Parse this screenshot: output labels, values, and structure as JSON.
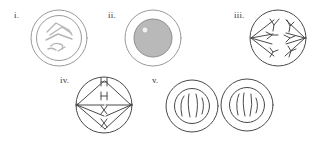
{
  "document": {
    "title": "Stages of Mitosis — Unlabeled Cell Diagrams",
    "background_color": "#ffffff",
    "ink_color": "#6e6e6e",
    "dark_ink_color": "#4a4a4a",
    "nucleus_fill_color": "#b9b9b9",
    "width": 318,
    "height": 142
  },
  "figures": [
    {
      "label": "i.",
      "name": "figure-i-prophase",
      "description": "Cell with outer plasma membrane, inner nuclear envelope, and several condensed rod-like chromosomes inside the nucleus",
      "chromosome_count": 4,
      "has_nuclear_envelope": true,
      "has_spindle": false,
      "nucleus_filled": false,
      "cell_count": 1
    },
    {
      "label": "ii.",
      "name": "figure-ii-interphase",
      "description": "Cell with outer membrane and a large solid shaded nucleus containing a small pale nucleolus",
      "chromosome_count": 0,
      "has_nuclear_envelope": true,
      "has_spindle": false,
      "nucleus_filled": true,
      "nucleolus_visible": true,
      "cell_count": 1
    },
    {
      "label": "iii.",
      "name": "figure-iii-anaphase",
      "description": "Cell without nuclear envelope; V-shaped chromosomes drawn toward opposite left and right poles by spindle fibers",
      "chromosome_count": 6,
      "has_nuclear_envelope": false,
      "has_spindle": true,
      "nucleus_filled": false,
      "cell_count": 1
    },
    {
      "label": "iv.",
      "name": "figure-iv-metaphase",
      "description": "Cell with chromosomes aligned in a single vertical row at the equator; spindle fibers radiate from left and right poles",
      "chromosome_count": 4,
      "has_nuclear_envelope": false,
      "has_spindle": true,
      "nucleus_filled": false,
      "cell_count": 1
    },
    {
      "label": "v.",
      "name": "figure-v-telophase-cytokinesis",
      "description": "Two adjoining daughter cells, each with a reformed nuclear envelope enclosing decondensing chromosomes",
      "chromosome_count": 6,
      "has_nuclear_envelope": true,
      "has_spindle": false,
      "nucleus_filled": false,
      "cell_count": 2
    }
  ]
}
